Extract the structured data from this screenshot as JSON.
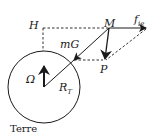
{
  "diagram": {
    "labels": {
      "H": "H",
      "M": "M",
      "f": "f",
      "f_sub": "ie",
      "mG": "mG",
      "P": "P",
      "Omega": "Ω",
      "R": "R",
      "R_sub": "T",
      "earth": "Terre"
    },
    "colors": {
      "stroke": "#1a1a1a",
      "background": "#ffffff"
    }
  }
}
